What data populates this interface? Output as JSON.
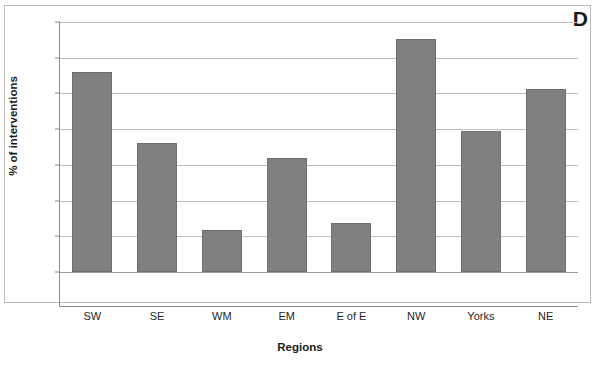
{
  "figure": {
    "panel_label": "D",
    "bar_color": "#808080",
    "bar_border_color": "#6e6e6e",
    "grid_color": "#bdbdbd",
    "axis_color": "#8c8c8c",
    "frame_color": "#b9b9b9",
    "text_color": "#1f1f1f"
  },
  "chart_data": {
    "type": "bar",
    "title": "",
    "xlabel": "Regions",
    "ylabel": "% of interventions",
    "categories": [
      "SW",
      "SE",
      "WM",
      "EM",
      "E of E",
      "NW",
      "Yorks",
      "NE"
    ],
    "values": [
      28.0,
      18.0,
      5.9,
      15.9,
      6.8,
      32.6,
      19.7,
      25.6
    ],
    "ylim": [
      0,
      35
    ],
    "ytick_values": [
      0,
      5,
      10,
      15,
      20,
      25,
      30,
      35
    ],
    "ytick_labels": [
      "0",
      "5",
      "5",
      "15",
      "20",
      "25",
      "30",
      "35"
    ],
    "grid": "horizontal",
    "legend": "none",
    "annotations": [
      "D"
    ]
  }
}
